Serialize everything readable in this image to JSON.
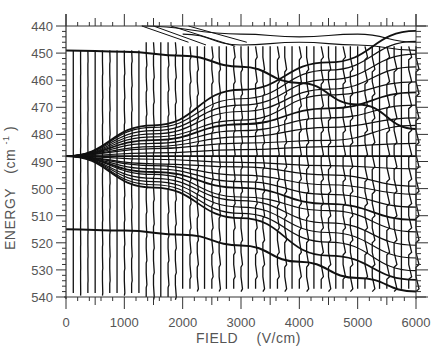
{
  "chart_data": {
    "type": "line",
    "title": "",
    "xlabel": "FIELD (V/cm)",
    "ylabel": "ENERGY (cm⁻¹)",
    "xlabel_parts": {
      "main": "FIELD",
      "unit": "(V/cm)"
    },
    "ylabel_parts": {
      "main": "ENERGY",
      "unit_base": "(cm",
      "unit_exp": "-1",
      "unit_close": ")"
    },
    "xlim": [
      0,
      6000
    ],
    "ylim": [
      440,
      540
    ],
    "y_inverted": true,
    "x_ticks": [
      0,
      1000,
      2000,
      3000,
      4000,
      5000,
      6000
    ],
    "y_ticks": [
      440,
      450,
      460,
      470,
      480,
      490,
      500,
      510,
      520,
      530,
      540
    ],
    "x_tick_labels": [
      "0",
      "1000",
      "2000",
      "3000",
      "4000",
      "5000",
      "6000"
    ],
    "y_tick_labels": [
      "440",
      "450",
      "460",
      "470",
      "480",
      "490",
      "500",
      "510",
      "520",
      "530",
      "540"
    ],
    "grid": false,
    "legend": null,
    "series": [
      {
        "name": "level-449",
        "x": [
          0,
          1000,
          2000,
          3000,
          4000,
          5000,
          6000
        ],
        "values": [
          449,
          449.5,
          451,
          455,
          461,
          469,
          478
        ]
      },
      {
        "name": "level-515",
        "x": [
          0,
          1000,
          2000,
          3000,
          4000,
          5000,
          6000
        ],
        "values": [
          515,
          515.5,
          517,
          521,
          527,
          533,
          538
        ]
      },
      {
        "name": "fan-upper-edge",
        "x": [
          0,
          6000
        ],
        "values": [
          488,
          441
        ]
      },
      {
        "name": "fan-lower-edge",
        "x": [
          0,
          6000
        ],
        "values": [
          488,
          535
        ]
      },
      {
        "name": "top-wave-1",
        "x": [
          1300,
          3000,
          4000,
          5000,
          6000
        ],
        "values": [
          440,
          443,
          444,
          443,
          446
        ]
      },
      {
        "name": "top-wave-2",
        "x": [
          2000,
          3000,
          4000,
          5000,
          6000
        ],
        "values": [
          443,
          447,
          446,
          447,
          449
        ]
      }
    ],
    "vertical_trace_step": 125,
    "fan_origin": {
      "x": 0,
      "y": 488
    },
    "fan_line_count": 20
  },
  "colors": {
    "ink": "#111111",
    "axis": "#333333",
    "label": "#555555",
    "background": "#ffffff"
  }
}
